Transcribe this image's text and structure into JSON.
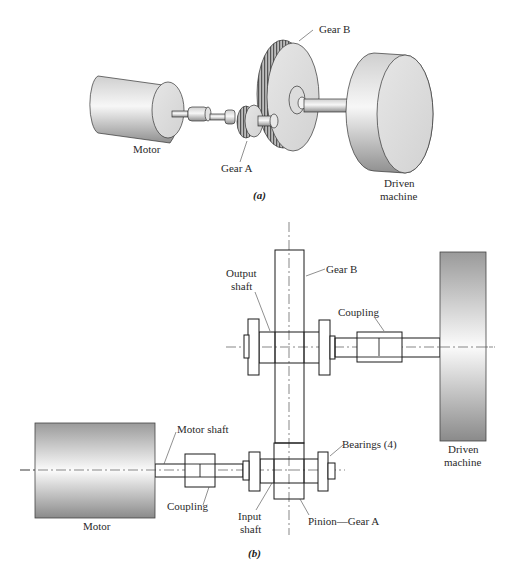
{
  "figure_a": {
    "caption": "(a)",
    "labels": {
      "motor": "Motor",
      "gear_a": "Gear A",
      "gear_b": "Gear B",
      "driven_1": "Driven",
      "driven_2": "machine"
    }
  },
  "figure_b": {
    "caption": "(b)",
    "labels": {
      "gear_b": "Gear B",
      "output_shaft_1": "Output",
      "output_shaft_2": "shaft",
      "coupling_top": "Coupling",
      "driven_1": "Driven",
      "driven_2": "machine",
      "motor_shaft": "Motor shaft",
      "bearings": "Bearings (4)",
      "motor": "Motor",
      "coupling_bottom": "Coupling",
      "input_shaft_1": "Input",
      "input_shaft_2": "shaft",
      "pinion": "Pinion—Gear A"
    }
  },
  "colors": {
    "line": "#1a1a1a",
    "metal_light": "#f2f2f2",
    "metal_dark": "#8a8a8a"
  }
}
